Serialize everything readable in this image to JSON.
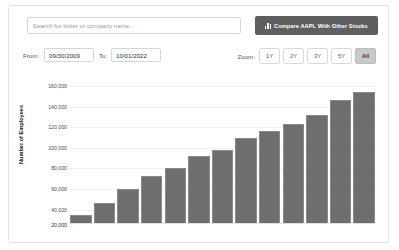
{
  "toolbar": {
    "search_placeholder": "Search for ticker or company name...",
    "search_value": "",
    "compare_button_label": "Compare AAPL With Other Stocks",
    "compare_icon": "bar-chart-icon"
  },
  "controls": {
    "from_label": "From:",
    "from_value": "09/30/2009",
    "to_label": "To:",
    "to_value": "10/01/2022",
    "zoom_label": "Zoom:",
    "zoom_options": [
      "1Y",
      "2Y",
      "3Y",
      "5Y",
      "All"
    ],
    "zoom_selected": "All"
  },
  "colors": {
    "bar": "#6e6e6e",
    "button": "#5f5f5f",
    "active_zoom": "#c9c9c9",
    "border": "#e2e2e2"
  },
  "chart_data": {
    "type": "bar",
    "title": "",
    "xlabel": "",
    "ylabel": "Number of Employees",
    "ylim": [
      26000,
      166000
    ],
    "grid": true,
    "legend": "none",
    "ytick_labels": [
      "160,000",
      "140,000",
      "120,000",
      "100,000",
      "80,000",
      "60,000",
      "40,000"
    ],
    "ytick_values": [
      160000,
      140000,
      120000,
      100000,
      80000,
      60000,
      40000
    ],
    "bottom_tick_label": "20,000",
    "categories": [
      "2009",
      "2010",
      "2011",
      "2012",
      "2013",
      "2014",
      "2015",
      "2016",
      "2017",
      "2018",
      "2019",
      "2020",
      "2021"
    ],
    "values": [
      34300,
      46600,
      60400,
      72800,
      80300,
      92600,
      98000,
      110000,
      116000,
      123000,
      132000,
      147000,
      154000
    ]
  }
}
